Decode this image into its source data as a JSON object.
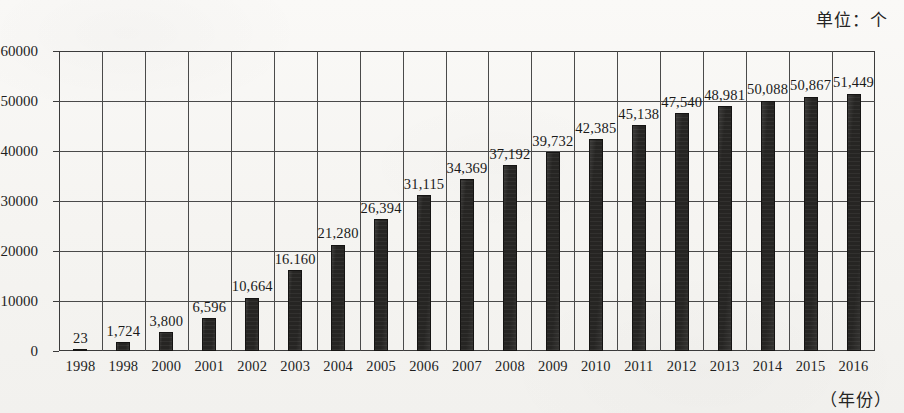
{
  "unit_title": "单位：个",
  "xaxis_title": "（年份）",
  "chart_data": {
    "type": "bar",
    "title": "单位：个",
    "xlabel": "（年份）",
    "ylabel": "",
    "ylim": [
      0,
      60000
    ],
    "ytick_labels": [
      "0",
      "10000",
      "20000",
      "30000",
      "40000",
      "50000",
      "60000"
    ],
    "ytick_values": [
      0,
      10000,
      20000,
      30000,
      40000,
      50000,
      60000
    ],
    "grid": "both",
    "legend": "none",
    "bar_color": "#262523",
    "categories": [
      "1998",
      "1998",
      "2000",
      "2001",
      "2002",
      "2003",
      "2004",
      "2005",
      "2006",
      "2007",
      "2008",
      "2009",
      "2010",
      "2011",
      "2012",
      "2013",
      "2014",
      "2015",
      "2016"
    ],
    "values": [
      23,
      1724,
      3800,
      6596,
      10664,
      16160,
      21280,
      26394,
      31115,
      34369,
      37192,
      39732,
      42385,
      45138,
      47540,
      48981,
      50088,
      50867,
      51449
    ],
    "data_labels": [
      "23",
      "1,724",
      "3,800",
      "6,596",
      "10,664",
      "16.160",
      "21,280",
      "26,394",
      "31,115",
      "34,369",
      "37,192",
      "39,732",
      "42,385",
      "45,138",
      "47,540",
      "48,981",
      "50,088",
      "50,867",
      "51,449"
    ]
  }
}
